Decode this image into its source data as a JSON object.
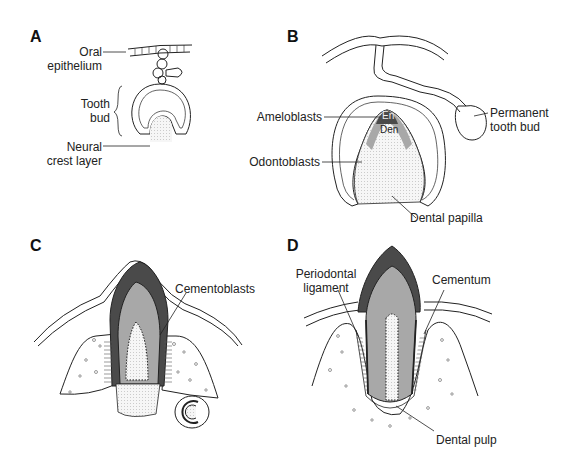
{
  "figure": {
    "panels": [
      {
        "id": "A",
        "labels": {
          "oral_epithelium": [
            "Oral",
            "epithelium"
          ],
          "tooth_bud": [
            "Tooth",
            "bud"
          ],
          "neural_crest_layer": [
            "Neural",
            "crest layer"
          ]
        }
      },
      {
        "id": "B",
        "labels": {
          "ameloblasts": "Ameloblasts",
          "odontoblasts": "Odontoblasts",
          "enamel": "En",
          "dentin": "Den",
          "permanent_tooth_bud": [
            "Permanent",
            "tooth bud"
          ],
          "dental_papilla": "Dental papilla"
        }
      },
      {
        "id": "C",
        "labels": {
          "cementoblasts": "Cementoblasts"
        }
      },
      {
        "id": "D",
        "labels": {
          "periodontal_ligament": [
            "Periodontal",
            "ligament"
          ],
          "cementum": "Cementum",
          "dental_pulp": "Dental pulp"
        }
      }
    ],
    "colors": {
      "enamel": "#4a4a4a",
      "dentin": "#a8a8a8",
      "pulp": "#ececec",
      "line": "#222222"
    }
  }
}
